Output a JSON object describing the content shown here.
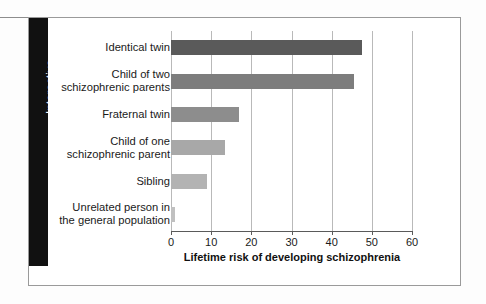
{
  "sidebar_tab": {
    "label": "Interactive"
  },
  "chart_data": {
    "type": "bar",
    "orientation": "horizontal",
    "title": "",
    "xlabel": "Lifetime risk of developing schizophrenia",
    "ylabel": "",
    "xlim": [
      0,
      60
    ],
    "xticks": [
      0,
      10,
      20,
      30,
      40,
      50,
      60
    ],
    "xtick_labels": [
      "0",
      "10",
      "20",
      "30",
      "40",
      "50",
      "60"
    ],
    "grid": true,
    "grid_axis": "x",
    "legend": false,
    "categories": [
      "Identical twin",
      "Child of two\nschizophrenic parents",
      "Fraternal twin",
      "Child of one\nschizophrenic parent",
      "Sibling",
      "Unrelated person in\nthe general population"
    ],
    "values": [
      47.5,
      45.5,
      17,
      13.5,
      9,
      1
    ],
    "bar_colors": [
      "#5a5a5a",
      "#7d7d7d",
      "#8d8d8d",
      "#a8a8a8",
      "#b3b3b3",
      "#c0c0c0"
    ]
  }
}
